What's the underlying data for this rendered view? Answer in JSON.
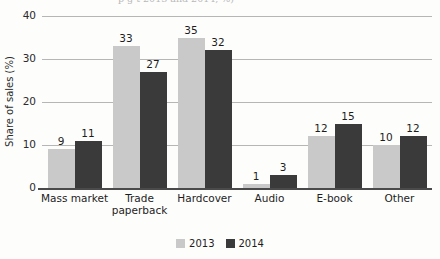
{
  "title_fragment": "p      g                                                   t   2013 and 2014, %)",
  "chart_data": {
    "type": "bar",
    "title": "",
    "xlabel": "",
    "ylabel": "Share of sales (%)",
    "ylim": [
      0,
      40
    ],
    "yticks": [
      0,
      10,
      20,
      30,
      40
    ],
    "grid": true,
    "legend_position": "bottom",
    "categories": [
      "Mass market",
      "Trade paperback",
      "Hardcover",
      "Audio",
      "E-book",
      "Other"
    ],
    "category_lines": [
      [
        "Mass market"
      ],
      [
        "Trade",
        "paperback"
      ],
      [
        "Hardcover"
      ],
      [
        "Audio"
      ],
      [
        "E-book"
      ],
      [
        "Other"
      ]
    ],
    "series": [
      {
        "name": "2013",
        "color": "#c9c9c9",
        "values": [
          9,
          33,
          35,
          1,
          12,
          10
        ]
      },
      {
        "name": "2014",
        "color": "#3a3a3a",
        "values": [
          11,
          27,
          32,
          3,
          15,
          12
        ]
      }
    ]
  },
  "colors": {
    "series_2013": "#c9c9c9",
    "series_2014": "#3a3a3a",
    "gridline": "#b6b6b6",
    "axis": "#4a4a4a",
    "text": "#1d1d1d",
    "background": "#fdfdfc"
  }
}
